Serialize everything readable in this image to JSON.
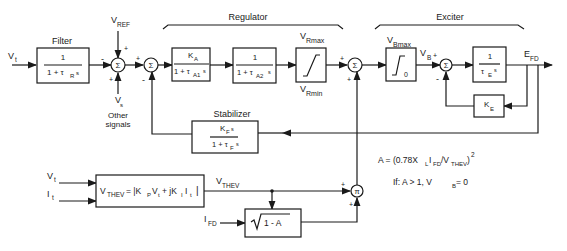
{
  "diagram": {
    "type": "block-diagram",
    "groups": {
      "regulator": "Regulator",
      "exciter": "Exciter",
      "filter": "Filter",
      "stabilizer": "Stabilizer"
    },
    "inputs": {
      "vt_main": "V",
      "vt_main_sub": "t",
      "vref": "V",
      "vref_sub": "REF",
      "vs": "V",
      "vs_sub": "s",
      "other_signals_1": "Other",
      "other_signals_2": "signals",
      "vt_lower": "V",
      "vt_lower_sub": "t",
      "it_lower": "I",
      "it_lower_sub": "t",
      "ifd": "I",
      "ifd_sub": "FD"
    },
    "blocks": {
      "filter": {
        "num": "1",
        "den": "1 + τ",
        "den_sub": "R",
        "den_tail": "s"
      },
      "ka": {
        "num": "K",
        "num_sub": "A",
        "den": "1 + τ",
        "den_sub": "A1",
        "den_tail": "s"
      },
      "ta2": {
        "num": "1",
        "den": "1 + τ",
        "den_sub": "A2",
        "den_tail": "s"
      },
      "vr_limit": {
        "max": "V",
        "max_sub": "Rmax",
        "min": "V",
        "min_sub": "Rmin"
      },
      "vb_limit": {
        "max": "V",
        "max_sub": "Bmax",
        "zero": "0"
      },
      "exciter_te": {
        "num": "1",
        "den": "τ",
        "den_sub": "E",
        "den_tail": "s"
      },
      "ke": {
        "label": "K",
        "label_sub": "E"
      },
      "stabilizer": {
        "num": "K",
        "num_sub": "F",
        "num_tail": "s",
        "den": "1 + τ",
        "den_sub": "F",
        "den_tail": "s"
      },
      "vthev": {
        "lhs": "V",
        "lhs_sub": "THEV",
        "rhs": " = |K",
        "rhs_sub1": "P",
        "rhs_mid": "V",
        "rhs_sub2": "t",
        "rhs_mid2": " + jK",
        "rhs_sub3": "I",
        "rhs_mid3": "I",
        "rhs_sub4": "t",
        "rhs_end": "|"
      },
      "sqrt": {
        "label": "1 - A"
      }
    },
    "signals": {
      "vthev_out": "V",
      "vthev_out_sub": "THEV",
      "vb": "V",
      "vb_sub": "B",
      "efd": "E",
      "efd_sub": "FD"
    },
    "summing_points": {
      "sum1": "Σ",
      "sum2": "Σ",
      "sum3": "Σ",
      "sum4": "Σ",
      "mult": "π"
    },
    "signs": {
      "minus": "-",
      "plus": "+"
    },
    "equations": {
      "a_def": "A = (0.78X",
      "a_def_sub1": "L",
      "a_def_mid": "I",
      "a_def_sub2": "FD",
      "a_def_mid2": "/V",
      "a_def_sub3": "THEV",
      "a_def_end": ")",
      "a_def_sup": "2",
      "condition": "If:  A > 1, V",
      "condition_sub": "B",
      "condition_end": " = 0"
    }
  }
}
